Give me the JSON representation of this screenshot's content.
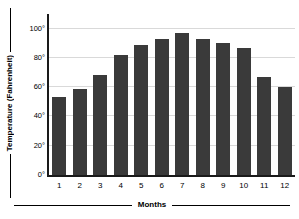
{
  "chart_data": {
    "type": "bar",
    "title": "",
    "xlabel": "Months",
    "ylabel": "Temperature (Fahrenheit)",
    "categories": [
      "1",
      "2",
      "3",
      "4",
      "5",
      "6",
      "7",
      "8",
      "9",
      "10",
      "11",
      "12"
    ],
    "values": [
      53,
      59,
      68,
      82,
      89,
      93,
      97,
      93,
      90,
      87,
      67,
      60
    ],
    "ylim": [
      0,
      110
    ],
    "yticks": [
      0,
      20,
      40,
      60,
      80,
      100
    ],
    "ytick_labels": [
      "0°",
      "20°",
      "40°",
      "60°",
      "80°",
      "100°"
    ],
    "grid": "horizontal",
    "legend": "none",
    "bar_color": "#3a3a3a",
    "grid_color": "#d9d9d9",
    "axis_color": "#1a1a1a",
    "background": "#ffffff"
  }
}
